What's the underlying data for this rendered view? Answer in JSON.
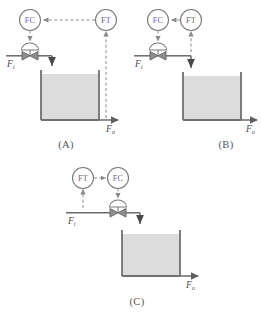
{
  "figure": {
    "type": "process-control-diagrams",
    "panel_count": 3,
    "colors": {
      "line": "#6f6f6f",
      "pipe": "#6a6a6a",
      "tank_wall": "#707070",
      "tank_fill": "#dcdcdc",
      "signal": "#8a8a8a",
      "text": "#555555",
      "background": "#ffffff"
    }
  },
  "panels": [
    {
      "id": "A",
      "caption": "(A)",
      "controller": {
        "tag": "FC",
        "name": "flow-controller"
      },
      "transmitter": {
        "tag": "FT",
        "name": "flow-transmitter"
      },
      "inlet_label": "F",
      "inlet_sub": "i",
      "outlet_label": "F",
      "outlet_sub": "o",
      "signal_path": "transmitter-to-controller",
      "sensed_stream": "outlet",
      "valve_on": "inlet"
    },
    {
      "id": "B",
      "caption": "(B)",
      "controller": {
        "tag": "FC",
        "name": "flow-controller"
      },
      "transmitter": {
        "tag": "FT",
        "name": "flow-transmitter"
      },
      "inlet_label": "F",
      "inlet_sub": "i",
      "outlet_label": "F",
      "outlet_sub": "o",
      "signal_path": "transmitter-to-controller",
      "sensed_stream": "inlet-downstream-of-valve",
      "valve_on": "inlet"
    },
    {
      "id": "C",
      "caption": "(C)",
      "controller": {
        "tag": "FC",
        "name": "flow-controller"
      },
      "transmitter": {
        "tag": "FT",
        "name": "flow-transmitter"
      },
      "inlet_label": "F",
      "inlet_sub": "i",
      "outlet_label": "F",
      "outlet_sub": "o",
      "signal_path": "transmitter-to-controller",
      "sensed_stream": "inlet-upstream-of-valve",
      "valve_on": "inlet-downstream-of-sensor"
    }
  ]
}
